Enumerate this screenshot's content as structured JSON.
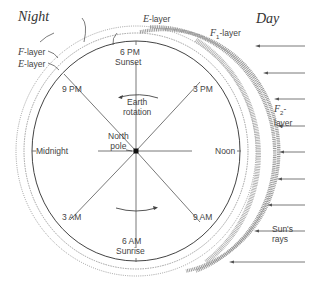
{
  "diagram": {
    "title_left": "Night",
    "title_right": "Day",
    "layers": {
      "e_top": {
        "letter": "E",
        "suffix": "-layer"
      },
      "f1": {
        "letter": "F",
        "sub": "1",
        "suffix": "-layer"
      },
      "f_left": {
        "letter": "F",
        "suffix": "-layer"
      },
      "e_left": {
        "letter": "E",
        "suffix": "-layer"
      },
      "f2": {
        "letter": "F",
        "sub": "2",
        "suffix": "-",
        "line2": "layer"
      }
    },
    "times": {
      "t6pm": "6 PM",
      "sunset": "Sunset",
      "t9pm": "9 PM",
      "t3pm": "3 PM",
      "midnight": "Midnight",
      "noon": "Noon",
      "t3am": "3 AM",
      "t9am": "9 AM",
      "t6am": "6 AM",
      "sunrise": "Sunrise"
    },
    "center": {
      "line1": "North",
      "line2": "pole"
    },
    "rotation": {
      "line1": "Earth",
      "line2": "rotation"
    },
    "sun": {
      "line1": "Sun's",
      "line2": "rays"
    },
    "colors": {
      "line": "#555555",
      "layer": "#888888",
      "text": "#444444"
    }
  }
}
